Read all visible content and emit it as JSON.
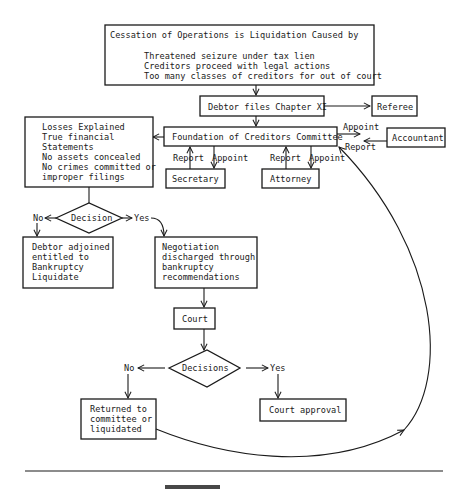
{
  "diagram": {
    "type": "flowchart",
    "nodes": {
      "cessation": {
        "title": "Cessation of Operations is Liquidation Caused by",
        "causes": [
          "Threatened seizure under tax lien",
          "Creditors proceed with legal actions",
          "Too many classes of creditors for out of court"
        ]
      },
      "chapter_xi": "Debtor files Chapter XI",
      "referee": "Referee",
      "committee": "Foundation of Creditors Committee",
      "accountant": "Accountant",
      "secretary": "Secretary",
      "attorney": "Attorney",
      "conditions": [
        "Losses Explained",
        "True financial",
        "Statements",
        "No assets concealed",
        "No crimes committed or",
        "improper filings"
      ],
      "decision1": "Decision",
      "adjoined": [
        "Debtor adjoined",
        "entitled to",
        "Bankruptcy",
        "Liquidate"
      ],
      "negotiation": [
        "Negotiation",
        "discharged through",
        "bankruptcy",
        "recommendations"
      ],
      "court": "Court",
      "decision2": "Decisions",
      "returned": [
        "Returned to",
        "committee or",
        "liquidated"
      ],
      "court_approval": "Court approval"
    },
    "edge_labels": {
      "appoint": "Appoint",
      "report": "Report",
      "no": "No",
      "yes": "Yes"
    }
  }
}
